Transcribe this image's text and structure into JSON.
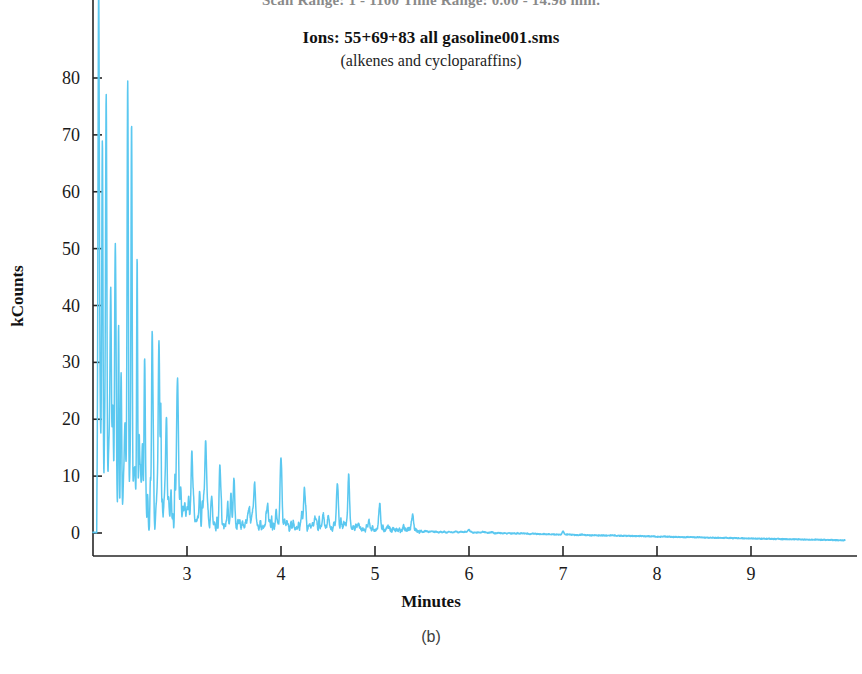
{
  "figure": {
    "instrument_line": "Scan Range: 1 - 1100  Time Range: 0.00 - 14.98 min.",
    "title": "Ions: 55+69+83 all gasoline001.sms",
    "subtitle": "(alkenes and cycloparaffins)",
    "panel_caption": "(b)"
  },
  "chart_data": {
    "type": "line",
    "title": "Ions: 55+69+83 all gasoline001.sms",
    "subtitle": "(alkenes and cycloparaffins)",
    "xlabel": "Minutes",
    "ylabel": "kCounts",
    "xlim": [
      2.0,
      10.0
    ],
    "ylim": [
      -4,
      88
    ],
    "xticks": [
      3,
      4,
      5,
      6,
      7,
      8,
      9
    ],
    "yticks": [
      0,
      10,
      20,
      30,
      40,
      50,
      60,
      70,
      80
    ],
    "grid": false,
    "legend": "none",
    "trace_color": "#5BC8F0",
    "axis_color": "#262626",
    "series": [
      {
        "name": "Ions 55+69+83 (alkenes and cycloparaffins)",
        "notable_peaks": [
          {
            "minutes": 2.06,
            "kcounts": 83
          },
          {
            "minutes": 2.1,
            "kcounts": 58
          },
          {
            "minutes": 2.14,
            "kcounts": 47
          },
          {
            "minutes": 2.19,
            "kcounts": 30
          },
          {
            "minutes": 2.24,
            "kcounts": 32
          },
          {
            "minutes": 2.3,
            "kcounts": 18
          },
          {
            "minutes": 2.37,
            "kcounts": 70
          },
          {
            "minutes": 2.41,
            "kcounts": 64
          },
          {
            "minutes": 2.47,
            "kcounts": 24
          },
          {
            "minutes": 2.55,
            "kcounts": 22
          },
          {
            "minutes": 2.63,
            "kcounts": 31
          },
          {
            "minutes": 2.7,
            "kcounts": 29
          },
          {
            "minutes": 2.78,
            "kcounts": 16
          },
          {
            "minutes": 2.9,
            "kcounts": 13
          },
          {
            "minutes": 3.05,
            "kcounts": 12
          },
          {
            "minutes": 3.2,
            "kcounts": 11
          },
          {
            "minutes": 3.35,
            "kcounts": 11
          },
          {
            "minutes": 3.5,
            "kcounts": 9
          },
          {
            "minutes": 3.72,
            "kcounts": 7
          },
          {
            "minutes": 4.0,
            "kcounts": 12
          },
          {
            "minutes": 4.25,
            "kcounts": 7
          },
          {
            "minutes": 4.6,
            "kcounts": 8
          },
          {
            "minutes": 4.72,
            "kcounts": 8
          },
          {
            "minutes": 5.05,
            "kcounts": 4
          },
          {
            "minutes": 5.4,
            "kcounts": 3
          },
          {
            "minutes": 6.0,
            "kcounts": 0.5
          },
          {
            "minutes": 7.0,
            "kcounts": 0.2
          },
          {
            "minutes": 8.0,
            "kcounts": -0.2
          },
          {
            "minutes": 9.0,
            "kcounts": -0.6
          },
          {
            "minutes": 9.9,
            "kcounts": -1.2
          }
        ]
      }
    ]
  }
}
